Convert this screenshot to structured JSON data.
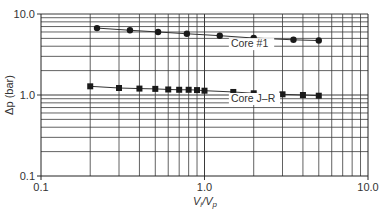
{
  "chart_data": {
    "type": "scatter",
    "title": "",
    "xlabel": "Vi/Vp",
    "xlabel_parts": {
      "main": "V",
      "sub1": "i",
      "sep": "/V",
      "sub2": "p"
    },
    "ylabel": "Δp (bar)",
    "xscale": "log",
    "yscale": "log",
    "xlim": [
      0.1,
      10.0
    ],
    "ylim": [
      0.1,
      10.0
    ],
    "x_ticks": [
      "0.1",
      "1.0",
      "10.0"
    ],
    "y_ticks": [
      "0.1",
      "1.0",
      "10.0"
    ],
    "grid": true,
    "legend": "none (inline labels)",
    "series": [
      {
        "name": "Core #1",
        "marker": "circle",
        "x": [
          0.22,
          0.35,
          0.52,
          0.78,
          1.24,
          2.0,
          3.5,
          5.0
        ],
        "y": [
          6.7,
          6.3,
          6.0,
          5.7,
          5.4,
          5.05,
          4.8,
          4.7
        ]
      },
      {
        "name": "Core J–R",
        "marker": "square",
        "x": [
          0.2,
          0.3,
          0.4,
          0.5,
          0.6,
          0.7,
          0.8,
          0.9,
          1.0,
          1.5,
          2.0,
          3.0,
          4.0,
          5.0
        ],
        "y": [
          1.28,
          1.22,
          1.2,
          1.19,
          1.17,
          1.16,
          1.16,
          1.15,
          1.13,
          1.09,
          1.05,
          1.02,
          1.0,
          0.98
        ]
      }
    ],
    "annotations": [
      {
        "text": "Core #1",
        "x": 1.45,
        "y": 3.9
      },
      {
        "text": "Core J–R",
        "x": 1.45,
        "y": 0.82
      }
    ]
  },
  "colors": {
    "grid": "#3a3a3a",
    "marker": "#1a1a1a",
    "line": "#333333"
  }
}
